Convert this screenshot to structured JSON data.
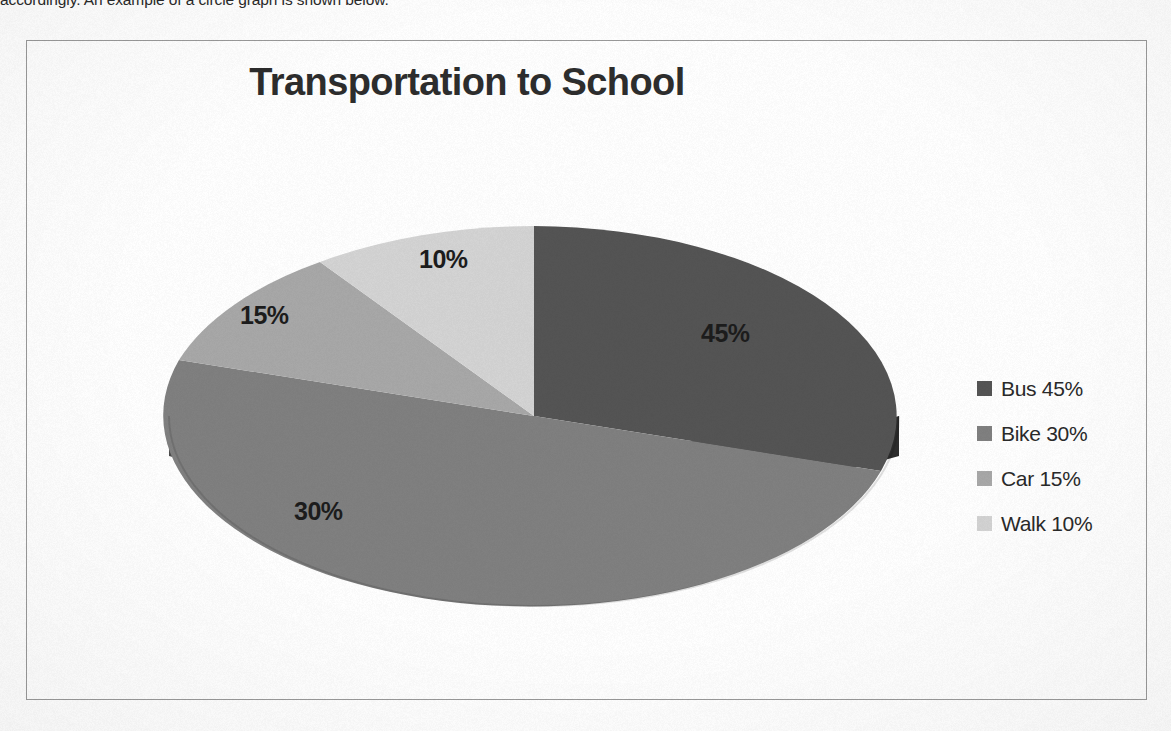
{
  "document": {
    "intro_text": "accordingly. An example of a circle graph is shown below."
  },
  "chart_data": {
    "type": "pie",
    "title": "Transportation to School",
    "xlabel": "",
    "ylabel": "",
    "categories": [
      "Bus",
      "Bike",
      "Car",
      "Walk"
    ],
    "values": [
      45,
      30,
      15,
      10
    ],
    "value_unit": "%",
    "data_labels": [
      "45%",
      "30%",
      "15%",
      "10%"
    ],
    "legend_entries": [
      "Bus 45%",
      "Bike 30%",
      "Car 15%",
      "Walk 10%"
    ],
    "legend_position": "right",
    "three_d": true,
    "grid": false,
    "colors": [
      "#545454",
      "#808080",
      "#a8a8a8",
      "#d4d4d4"
    ],
    "side_colors": [
      "#2b2b2b",
      "#414141",
      "#565656",
      "#6d6d6d"
    ]
  },
  "legend": {
    "rows": [
      {
        "label": "Bus 45%",
        "color": "#545454"
      },
      {
        "label": "Bike 30%",
        "color": "#808080"
      },
      {
        "label": "Car 15%",
        "color": "#a8a8a8"
      },
      {
        "label": "Walk 10%",
        "color": "#d4d4d4"
      }
    ]
  },
  "frame": {
    "border_color": "#9a9a9a"
  }
}
